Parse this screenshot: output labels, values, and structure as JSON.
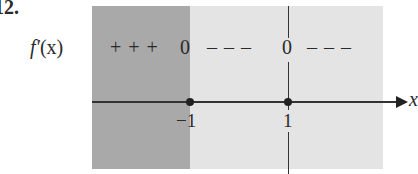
{
  "problem": {
    "number": "12."
  },
  "sign_chart": {
    "function_label": "f′",
    "function_arg": "(x)",
    "axis_label": "x",
    "critical_points": [
      {
        "value": -1,
        "label": "−1"
      },
      {
        "value": 1,
        "label": "1"
      }
    ],
    "intervals": [
      {
        "range": "(-inf, -1)",
        "sign": "+ + +",
        "shading": "dark"
      },
      {
        "range": "(-1, 1)",
        "sign": "– – –",
        "shading": "light"
      },
      {
        "range": "(1, inf)",
        "sign": "– – –",
        "shading": "light"
      }
    ],
    "zeros": [
      "0",
      "0"
    ]
  },
  "colors": {
    "dark_region": "#a9a9a9",
    "light_region": "#e4e4e4",
    "ink": "#2a2a2a"
  }
}
